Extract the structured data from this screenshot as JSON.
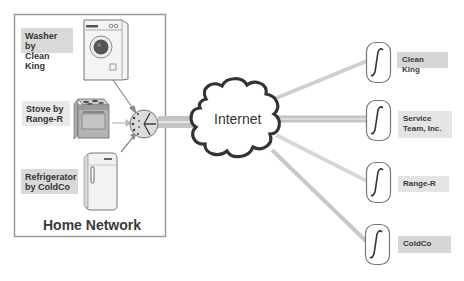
{
  "home_network": {
    "title": "Home Network",
    "devices": [
      {
        "name": "washer",
        "label": "Washer by\nClean King",
        "label_line1": "Washer by",
        "label_line2": "Clean King"
      },
      {
        "name": "stove",
        "label": "Stove by\nRange-R",
        "label_line1": "Stove by",
        "label_line2": "Range-R"
      },
      {
        "name": "refrigerator",
        "label": "Refrigerator\nby ColdCo",
        "label_line1": "Refrigerator",
        "label_line2": "by ColdCo"
      }
    ],
    "hub_icon": "network-hub-icon"
  },
  "internet": {
    "label": "Internet",
    "icon": "cloud-icon"
  },
  "service_providers": [
    {
      "name": "clean-king",
      "label_line1": "Clean King",
      "label_line2": "",
      "icon": "integral-service-icon"
    },
    {
      "name": "service-team",
      "label_line1": "Service",
      "label_line2": "Team, Inc.",
      "icon": "integral-service-icon"
    },
    {
      "name": "range-r",
      "label_line1": "Range-R",
      "label_line2": "",
      "icon": "integral-service-icon"
    },
    {
      "name": "coldco",
      "label_line1": "ColdCo",
      "label_line2": "",
      "icon": "integral-service-icon"
    }
  ],
  "colors": {
    "label_bg": "#d9d9d9",
    "line": "#c8c8c8",
    "cloud_stroke": "#333333",
    "box_border": "#9a9a9a"
  }
}
